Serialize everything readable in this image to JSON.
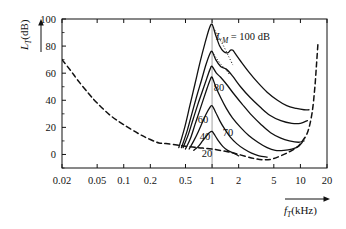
{
  "chart_data": {
    "type": "line",
    "title": "",
    "xlabel": "f_T (kHz)",
    "ylabel": "L_T (dB)",
    "xlabel_var": "f",
    "xlabel_sub": "T",
    "xlabel_unit": "(kHz)",
    "ylabel_var": "L",
    "ylabel_sub": "T",
    "ylabel_unit": "(dB)",
    "xscale": "log",
    "xlim": [
      0.02,
      20
    ],
    "ylim": [
      -10,
      100
    ],
    "grid": false,
    "legend_position": "inline-annotations",
    "xticks": [
      0.02,
      0.05,
      0.1,
      0.2,
      0.5,
      1,
      2,
      5,
      10,
      20
    ],
    "xtick_labels": [
      "0.02",
      "0.05",
      "0.1",
      "0.2",
      "0.5",
      "1",
      "2",
      "5",
      "10",
      "20"
    ],
    "yticks": [
      0,
      20,
      40,
      60,
      80,
      100
    ],
    "ytick_labels": [
      "0",
      "20",
      "40",
      "60",
      "80",
      "100"
    ],
    "masker_frequency_khz": 1,
    "annotations": [
      {
        "name": "lm-100-label",
        "text_var": "L",
        "text_sub": "M",
        "text_rest": " = 100 dB",
        "x_px": 243,
        "y_px": 40
      },
      {
        "name": "curve-label-80",
        "text": "80",
        "x_px": 219,
        "y_px": 91
      },
      {
        "name": "curve-label-70",
        "text": "70",
        "x_px": 228,
        "y_px": 136
      },
      {
        "name": "curve-label-60",
        "text": "60",
        "x_px": 203,
        "y_px": 123
      },
      {
        "name": "curve-label-40",
        "text": "40",
        "x_px": 205,
        "y_px": 140
      },
      {
        "name": "curve-label-20",
        "text": "20",
        "x_px": 207,
        "y_px": 157
      }
    ],
    "series": [
      {
        "name": "hearing-threshold-in-quiet",
        "label": "threshold in quiet",
        "style": "dashed",
        "points": [
          [
            0.02,
            70
          ],
          [
            0.025,
            62
          ],
          [
            0.03,
            55
          ],
          [
            0.04,
            45
          ],
          [
            0.05,
            38
          ],
          [
            0.07,
            29
          ],
          [
            0.1,
            22
          ],
          [
            0.15,
            15
          ],
          [
            0.2,
            11
          ],
          [
            0.25,
            8.5
          ],
          [
            0.3,
            8
          ],
          [
            0.4,
            7
          ],
          [
            0.5,
            6
          ],
          [
            0.7,
            5
          ],
          [
            1.0,
            4
          ],
          [
            1.5,
            2
          ],
          [
            2.0,
            0
          ],
          [
            3.0,
            -3
          ],
          [
            4.0,
            -4
          ],
          [
            5.0,
            -3
          ],
          [
            7.0,
            1
          ],
          [
            9.0,
            5
          ],
          [
            10.0,
            8
          ],
          [
            12.0,
            16
          ],
          [
            13.5,
            30
          ],
          [
            14.5,
            48
          ],
          [
            15.2,
            66
          ],
          [
            15.8,
            82
          ]
        ]
      },
      {
        "name": "masking-curve-20dB",
        "label": "20",
        "masker_level_db": 20,
        "style": "solid",
        "peak": [
          1.0,
          17
        ],
        "points": [
          [
            0.62,
            3
          ],
          [
            0.7,
            6
          ],
          [
            0.78,
            10
          ],
          [
            0.86,
            13.5
          ],
          [
            0.93,
            16
          ],
          [
            1.0,
            17
          ],
          [
            1.08,
            14
          ],
          [
            1.18,
            10
          ],
          [
            1.32,
            6
          ],
          [
            1.5,
            3
          ],
          [
            1.75,
            1
          ],
          [
            2.0,
            -1
          ]
        ]
      },
      {
        "name": "masking-curve-40dB",
        "label": "40",
        "masker_level_db": 40,
        "style": "solid",
        "peak": [
          1.0,
          36
        ],
        "points": [
          [
            0.55,
            4
          ],
          [
            0.62,
            10
          ],
          [
            0.7,
            17
          ],
          [
            0.78,
            24
          ],
          [
            0.86,
            30
          ],
          [
            0.93,
            34
          ],
          [
            1.0,
            36
          ],
          [
            1.1,
            31
          ],
          [
            1.22,
            25
          ],
          [
            1.38,
            19
          ],
          [
            1.6,
            13
          ],
          [
            1.9,
            8
          ],
          [
            2.3,
            4
          ],
          [
            2.8,
            1
          ],
          [
            3.4,
            -1
          ],
          [
            4.2,
            -2
          ]
        ]
      },
      {
        "name": "masking-curve-60dB",
        "label": "60",
        "masker_level_db": 60,
        "style": "solid",
        "peak": [
          1.0,
          57
        ],
        "points": [
          [
            0.5,
            4
          ],
          [
            0.57,
            12
          ],
          [
            0.64,
            22
          ],
          [
            0.72,
            32
          ],
          [
            0.8,
            41
          ],
          [
            0.88,
            49
          ],
          [
            0.95,
            55
          ],
          [
            1.0,
            57
          ],
          [
            1.1,
            50
          ],
          [
            1.25,
            42
          ],
          [
            1.45,
            34
          ],
          [
            1.7,
            27
          ],
          [
            2.1,
            20
          ],
          [
            2.6,
            14
          ],
          [
            3.3,
            9
          ],
          [
            4.2,
            5
          ],
          [
            5.2,
            3
          ],
          [
            6.5,
            3
          ],
          [
            8.0,
            4
          ],
          [
            9.5,
            6
          ],
          [
            10.5,
            9
          ]
        ]
      },
      {
        "name": "masking-curve-70dB",
        "label": "70",
        "masker_level_db": 70,
        "style": "solid",
        "peak": [
          1.0,
          65
        ],
        "points": [
          [
            0.47,
            5
          ],
          [
            0.54,
            15
          ],
          [
            0.61,
            26
          ],
          [
            0.69,
            37
          ],
          [
            0.78,
            47
          ],
          [
            0.87,
            56
          ],
          [
            0.95,
            63
          ],
          [
            1.0,
            65
          ],
          [
            1.12,
            60
          ],
          [
            1.25,
            57
          ],
          [
            1.45,
            52
          ],
          [
            1.75,
            45
          ],
          [
            2.2,
            37
          ],
          [
            2.8,
            29
          ],
          [
            3.6,
            22
          ],
          [
            4.6,
            16
          ],
          [
            6.0,
            12
          ],
          [
            7.5,
            10
          ],
          [
            9.5,
            9
          ],
          [
            11.0,
            10
          ]
        ]
      },
      {
        "name": "masking-curve-80dB",
        "label": "80",
        "masker_level_db": 80,
        "style": "solid",
        "peak": [
          1.0,
          76
        ],
        "points": [
          [
            0.45,
            5
          ],
          [
            0.52,
            17
          ],
          [
            0.59,
            30
          ],
          [
            0.67,
            43
          ],
          [
            0.76,
            55
          ],
          [
            0.85,
            66
          ],
          [
            0.94,
            74
          ],
          [
            1.0,
            76
          ],
          [
            1.1,
            70
          ],
          [
            1.25,
            65
          ],
          [
            1.45,
            63
          ],
          [
            1.7,
            58
          ],
          [
            2.1,
            50
          ],
          [
            2.7,
            42
          ],
          [
            3.5,
            35
          ],
          [
            4.5,
            29
          ],
          [
            6.0,
            25
          ],
          [
            8.0,
            23
          ],
          [
            10.0,
            23
          ],
          [
            12.0,
            25
          ]
        ]
      },
      {
        "name": "masking-curve-100dB",
        "label": "100",
        "masker_level_db": 100,
        "style": "solid",
        "peak": [
          1.0,
          96
        ],
        "points": [
          [
            0.42,
            5
          ],
          [
            0.49,
            20
          ],
          [
            0.56,
            36
          ],
          [
            0.64,
            52
          ],
          [
            0.73,
            68
          ],
          [
            0.83,
            82
          ],
          [
            0.93,
            93
          ],
          [
            1.0,
            96
          ],
          [
            1.1,
            88
          ],
          [
            1.22,
            80
          ],
          [
            1.35,
            76
          ],
          [
            1.5,
            75
          ],
          [
            1.62,
            77
          ],
          [
            1.72,
            77
          ],
          [
            1.85,
            74
          ],
          [
            2.1,
            69
          ],
          [
            2.6,
            61
          ],
          [
            3.3,
            53
          ],
          [
            4.2,
            46
          ],
          [
            5.5,
            40
          ],
          [
            7.0,
            36
          ],
          [
            9.0,
            34
          ],
          [
            11.0,
            33
          ],
          [
            12.5,
            33
          ]
        ]
      }
    ],
    "dotted_segments": [
      {
        "name": "dotted-extension-100dB",
        "points": [
          [
            1.0,
            96
          ],
          [
            1.15,
            88
          ],
          [
            1.35,
            80
          ],
          [
            1.55,
            72
          ],
          [
            1.72,
            66
          ]
        ]
      },
      {
        "name": "dotted-extension-80dB",
        "points": [
          [
            1.0,
            76
          ],
          [
            1.12,
            71
          ],
          [
            1.28,
            66
          ],
          [
            1.45,
            62
          ],
          [
            1.58,
            59
          ]
        ]
      }
    ]
  },
  "axes": {
    "y_arrow": "up-arrow",
    "x_arrow": "right-arrow"
  }
}
